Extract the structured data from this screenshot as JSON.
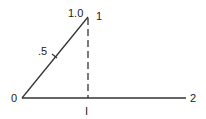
{
  "diagram": {
    "labels": {
      "origin": "0",
      "top_value": "1.0",
      "top_point": "1",
      "mid_value": ".5",
      "right_end": "2",
      "foot": "I"
    },
    "colors": {
      "line": "#333333",
      "background": "#ffffff"
    }
  }
}
